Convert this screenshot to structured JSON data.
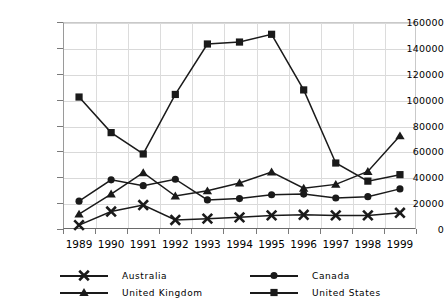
{
  "chart_data": {
    "type": "line",
    "title": "",
    "subtitle": "",
    "xlabel": "",
    "ylabel": "",
    "categories": [
      "1989",
      "1990",
      "1991",
      "1992",
      "1993",
      "1994",
      "1995",
      "1996",
      "1997",
      "1998",
      "1999"
    ],
    "x": [
      1989,
      1990,
      1991,
      1992,
      1993,
      1994,
      1995,
      1996,
      1997,
      1998,
      1999
    ],
    "ylim": [
      0,
      160000
    ],
    "ytick_values": [
      0,
      20000,
      40000,
      60000,
      80000,
      100000,
      120000,
      140000,
      160000
    ],
    "ytick_labels": [
      "0",
      "20000",
      "40000",
      "60000",
      "80000",
      "100000",
      "120000",
      "140000",
      "160000"
    ],
    "grid": true,
    "grid_axis": "both",
    "legend_position": "bottom",
    "legend_columns": 2,
    "series": [
      {
        "name": "Australia",
        "marker": "x-cross",
        "color": "#1a1a1a",
        "values": [
          3000,
          13500,
          18500,
          7000,
          8000,
          9000,
          10500,
          11000,
          10500,
          10500,
          12500
        ]
      },
      {
        "name": "Canada",
        "marker": "circle",
        "color": "#1a1a1a",
        "values": [
          21500,
          38000,
          33500,
          38500,
          22500,
          23500,
          26500,
          27000,
          24000,
          25000,
          31000
        ]
      },
      {
        "name": "United Kingdom",
        "marker": "triangle",
        "color": "#1a1a1a",
        "values": [
          11500,
          27000,
          43500,
          25500,
          29500,
          35500,
          44000,
          31500,
          34500,
          44500,
          72000
        ]
      },
      {
        "name": "United States",
        "marker": "square",
        "color": "#1a1a1a",
        "values": [
          102000,
          74500,
          58000,
          104000,
          143000,
          144500,
          150500,
          107500,
          51000,
          37000,
          42000
        ]
      }
    ]
  },
  "legend": {
    "entries": [
      {
        "label": "Australia",
        "marker": "x-cross"
      },
      {
        "label": "Canada",
        "marker": "circle"
      },
      {
        "label": "United Kingdom",
        "marker": "triangle"
      },
      {
        "label": "United States",
        "marker": "square"
      }
    ]
  },
  "colors": {
    "ink": "#1a1a1a",
    "grid": "#d9d9d9",
    "axis": "#6a6a6a",
    "background": "#ffffff"
  }
}
